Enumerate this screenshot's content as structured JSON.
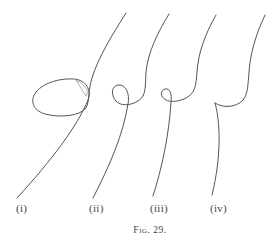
{
  "figure": {
    "caption": "Fig. 29.",
    "ink_color": "#555555",
    "background_color": "#ffffff",
    "panels": [
      {
        "id": "i",
        "label": "(i)",
        "description": "curve with large loop and inner cusp-like self-intersection"
      },
      {
        "id": "ii",
        "label": "(ii)",
        "description": "curve with small loop"
      },
      {
        "id": "iii",
        "label": "(iii)",
        "description": "curve with very small loop"
      },
      {
        "id": "iv",
        "label": "(iv)",
        "description": "curve with cusp (loop shrunk to a point)"
      }
    ]
  }
}
